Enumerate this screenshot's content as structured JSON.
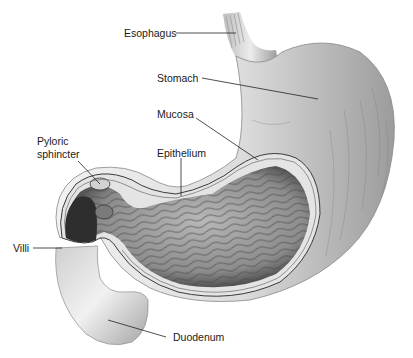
{
  "figure": {
    "background": "#ffffff",
    "colors": {
      "outer_light": "#eeeeee",
      "outer_mid": "#c8c8c8",
      "outer_dark": "#8a8a8a",
      "interior": "#9a9a9a",
      "interior_dark": "#3a3a3a",
      "wall": "#d9d9d9",
      "line": "#222222"
    }
  },
  "labels": {
    "esophagus": "Esophagus",
    "stomach": "Stomach",
    "mucosa": "Mucosa",
    "pyloric_1": "Pyloric",
    "pyloric_2": "sphincter",
    "epithelium": "Epithelium",
    "villi": "Villi",
    "duodenum": "Duodenum"
  }
}
